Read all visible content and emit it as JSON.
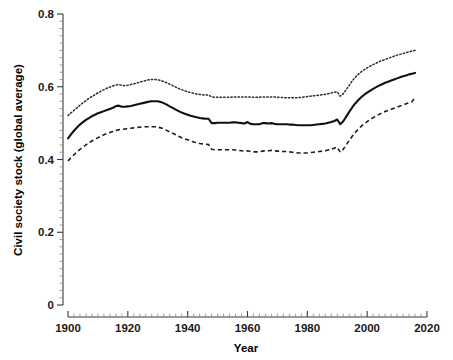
{
  "chart_data": {
    "type": "line",
    "title": "",
    "xlabel": "Year",
    "ylabel": "Civil society stock (global average)",
    "xlim": [
      1900,
      2020
    ],
    "ylim": [
      0,
      0.8
    ],
    "xticks": [
      1900,
      1920,
      1940,
      1960,
      1980,
      2000,
      2020
    ],
    "xtick_labels": [
      "1900",
      "1920",
      "1940",
      "1960",
      "1980",
      "2000",
      "2020"
    ],
    "yticks": [
      0,
      0.2,
      0.4,
      0.6,
      0.8
    ],
    "ytick_labels": [
      "0",
      "0.2",
      "0.4",
      "0.6",
      "0.8"
    ],
    "x_minor_tick_step": 2,
    "y_minor_tick_step": 0.02,
    "grid": false,
    "legend": "none",
    "x": [
      1900,
      1901,
      1902,
      1903,
      1904,
      1905,
      1906,
      1907,
      1908,
      1909,
      1910,
      1911,
      1912,
      1913,
      1914,
      1915,
      1916,
      1917,
      1918,
      1919,
      1920,
      1921,
      1922,
      1923,
      1924,
      1925,
      1926,
      1927,
      1928,
      1929,
      1930,
      1931,
      1932,
      1933,
      1934,
      1935,
      1936,
      1937,
      1938,
      1939,
      1940,
      1941,
      1942,
      1943,
      1944,
      1945,
      1946,
      1947,
      1948,
      1949,
      1950,
      1951,
      1952,
      1953,
      1954,
      1955,
      1956,
      1957,
      1958,
      1959,
      1960,
      1961,
      1962,
      1963,
      1964,
      1965,
      1966,
      1967,
      1968,
      1969,
      1970,
      1971,
      1972,
      1973,
      1974,
      1975,
      1976,
      1977,
      1978,
      1979,
      1980,
      1981,
      1982,
      1983,
      1984,
      1985,
      1986,
      1987,
      1988,
      1989,
      1990,
      1991,
      1992,
      1993,
      1994,
      1995,
      1996,
      1997,
      1998,
      1999,
      2000,
      2001,
      2002,
      2003,
      2004,
      2005,
      2006,
      2007,
      2008,
      2009,
      2010,
      2011,
      2012,
      2013,
      2014,
      2015,
      2016
    ],
    "series": [
      {
        "name": "Upper bound (95% CI)",
        "style": "dotted",
        "values": [
          0.521,
          0.528,
          0.535,
          0.542,
          0.549,
          0.556,
          0.562,
          0.568,
          0.573,
          0.578,
          0.583,
          0.588,
          0.592,
          0.596,
          0.599,
          0.602,
          0.605,
          0.606,
          0.604,
          0.603,
          0.604,
          0.606,
          0.608,
          0.61,
          0.613,
          0.615,
          0.617,
          0.619,
          0.62,
          0.62,
          0.619,
          0.617,
          0.614,
          0.611,
          0.607,
          0.603,
          0.599,
          0.595,
          0.592,
          0.589,
          0.586,
          0.584,
          0.582,
          0.58,
          0.579,
          0.578,
          0.577,
          0.577,
          0.572,
          0.571,
          0.571,
          0.571,
          0.571,
          0.571,
          0.571,
          0.572,
          0.572,
          0.572,
          0.572,
          0.572,
          0.572,
          0.572,
          0.571,
          0.571,
          0.571,
          0.572,
          0.572,
          0.572,
          0.572,
          0.572,
          0.571,
          0.571,
          0.57,
          0.57,
          0.57,
          0.57,
          0.57,
          0.57,
          0.571,
          0.572,
          0.573,
          0.574,
          0.575,
          0.576,
          0.577,
          0.578,
          0.579,
          0.581,
          0.583,
          0.585,
          0.586,
          0.574,
          0.581,
          0.592,
          0.604,
          0.616,
          0.626,
          0.634,
          0.641,
          0.647,
          0.652,
          0.657,
          0.661,
          0.665,
          0.669,
          0.672,
          0.675,
          0.678,
          0.681,
          0.684,
          0.687,
          0.689,
          0.691,
          0.694,
          0.696,
          0.698,
          0.7
        ]
      },
      {
        "name": "Mean (global average)",
        "style": "solid",
        "values": [
          0.458,
          0.469,
          0.479,
          0.488,
          0.496,
          0.503,
          0.509,
          0.514,
          0.519,
          0.523,
          0.527,
          0.53,
          0.533,
          0.536,
          0.539,
          0.542,
          0.547,
          0.548,
          0.545,
          0.545,
          0.546,
          0.547,
          0.549,
          0.551,
          0.553,
          0.555,
          0.557,
          0.559,
          0.56,
          0.56,
          0.56,
          0.558,
          0.555,
          0.551,
          0.546,
          0.542,
          0.537,
          0.533,
          0.529,
          0.526,
          0.523,
          0.52,
          0.518,
          0.516,
          0.514,
          0.513,
          0.512,
          0.512,
          0.5,
          0.5,
          0.501,
          0.501,
          0.501,
          0.501,
          0.501,
          0.502,
          0.502,
          0.501,
          0.5,
          0.499,
          0.503,
          0.498,
          0.497,
          0.497,
          0.497,
          0.5,
          0.5,
          0.499,
          0.5,
          0.498,
          0.497,
          0.497,
          0.497,
          0.497,
          0.496,
          0.496,
          0.495,
          0.494,
          0.494,
          0.494,
          0.494,
          0.494,
          0.495,
          0.496,
          0.497,
          0.498,
          0.499,
          0.501,
          0.503,
          0.506,
          0.51,
          0.497,
          0.505,
          0.518,
          0.531,
          0.543,
          0.554,
          0.563,
          0.571,
          0.578,
          0.584,
          0.589,
          0.594,
          0.599,
          0.603,
          0.607,
          0.611,
          0.614,
          0.617,
          0.62,
          0.623,
          0.626,
          0.629,
          0.631,
          0.634,
          0.636,
          0.638
        ]
      },
      {
        "name": "Lower bound (95% CI)",
        "style": "dashed",
        "values": [
          0.396,
          0.405,
          0.413,
          0.421,
          0.428,
          0.434,
          0.44,
          0.446,
          0.451,
          0.456,
          0.46,
          0.464,
          0.468,
          0.471,
          0.474,
          0.477,
          0.48,
          0.482,
          0.483,
          0.484,
          0.485,
          0.486,
          0.487,
          0.488,
          0.489,
          0.49,
          0.49,
          0.49,
          0.49,
          0.49,
          0.489,
          0.487,
          0.484,
          0.48,
          0.476,
          0.472,
          0.468,
          0.464,
          0.46,
          0.457,
          0.454,
          0.451,
          0.448,
          0.446,
          0.444,
          0.443,
          0.442,
          0.441,
          0.428,
          0.427,
          0.427,
          0.427,
          0.427,
          0.427,
          0.427,
          0.427,
          0.426,
          0.425,
          0.424,
          0.423,
          0.424,
          0.422,
          0.421,
          0.421,
          0.421,
          0.423,
          0.424,
          0.424,
          0.425,
          0.424,
          0.423,
          0.423,
          0.422,
          0.422,
          0.421,
          0.42,
          0.419,
          0.418,
          0.418,
          0.418,
          0.418,
          0.419,
          0.42,
          0.421,
          0.422,
          0.423,
          0.424,
          0.426,
          0.428,
          0.431,
          0.434,
          0.42,
          0.428,
          0.44,
          0.452,
          0.464,
          0.474,
          0.483,
          0.491,
          0.498,
          0.504,
          0.51,
          0.515,
          0.52,
          0.524,
          0.528,
          0.532,
          0.535,
          0.538,
          0.541,
          0.544,
          0.547,
          0.55,
          0.553,
          0.556,
          0.559,
          0.57
        ]
      }
    ]
  }
}
